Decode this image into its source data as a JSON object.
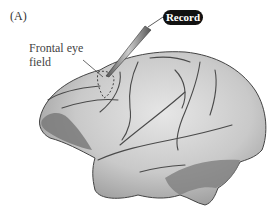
{
  "figure": {
    "panel_label": "(A)",
    "labels": {
      "frontal_eye_field_line1": "Frontal eye",
      "frontal_eye_field_line2": "field",
      "record": "Record"
    },
    "colors": {
      "brain_fill": "#cfcfcf",
      "brain_shadow": "#7a7a7a",
      "sulcus": "#4a4a4a",
      "record_badge": "#111111"
    }
  }
}
